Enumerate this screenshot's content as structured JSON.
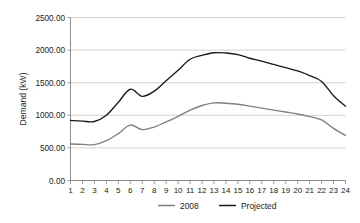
{
  "chart_data": {
    "type": "line",
    "title": "",
    "xlabel": "",
    "ylabel": "Demand (kW)",
    "ylim": [
      0,
      2500
    ],
    "xlim": [
      1,
      24
    ],
    "grid": true,
    "legend_position": "bottom",
    "y_ticks": [
      "0.00",
      "500.00",
      "1000.00",
      "1500.00",
      "2000.00",
      "2500.00"
    ],
    "y_tick_values": [
      0,
      500,
      1000,
      1500,
      2000,
      2500
    ],
    "categories": [
      "1",
      "2",
      "3",
      "4",
      "5",
      "6",
      "7",
      "8",
      "9",
      "10",
      "11",
      "12",
      "13",
      "14",
      "15",
      "16",
      "17",
      "18",
      "19",
      "20",
      "21",
      "22",
      "23",
      "24"
    ],
    "x": [
      1,
      2,
      3,
      4,
      5,
      6,
      7,
      8,
      9,
      10,
      11,
      12,
      13,
      14,
      15,
      16,
      17,
      18,
      19,
      20,
      21,
      22,
      23,
      24
    ],
    "series": [
      {
        "name": "2008",
        "color": "#7f7f7f",
        "values": [
          560,
          555,
          550,
          610,
          720,
          850,
          780,
          820,
          900,
          985,
          1080,
          1150,
          1190,
          1185,
          1170,
          1140,
          1110,
          1080,
          1050,
          1020,
          980,
          930,
          800,
          690
        ]
      },
      {
        "name": "Projected",
        "color": "#1a1a1a",
        "values": [
          920,
          910,
          905,
          1000,
          1200,
          1400,
          1290,
          1370,
          1530,
          1690,
          1860,
          1920,
          1960,
          1955,
          1930,
          1875,
          1830,
          1780,
          1730,
          1680,
          1610,
          1520,
          1300,
          1140
        ]
      }
    ],
    "legend": [
      {
        "label": "2008",
        "color": "#7f7f7f"
      },
      {
        "label": "Projected",
        "color": "#1a1a1a"
      }
    ]
  }
}
